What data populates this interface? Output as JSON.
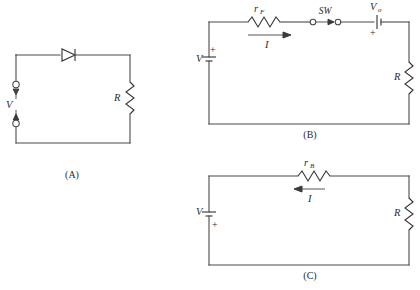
{
  "figure": {
    "background": "#ffffff",
    "line_color": "#4a4a4a",
    "text_color": "#2b2b2b",
    "panel_count": 3
  },
  "panel_a": {
    "caption": "(A)",
    "source_label": "V",
    "resistor_label": "R",
    "diode": "diode-symbol",
    "terminal_top": "terminal-circle",
    "terminal_bottom": "terminal-circle"
  },
  "panel_b": {
    "caption": "(B)",
    "source_label": "V",
    "source_polarity": "+",
    "series_resistor_label": "r",
    "series_resistor_sub": "F",
    "switch_label": "SW",
    "current_label": "I",
    "current_direction": "right",
    "offset_source_label": "V",
    "offset_source_sub": "o",
    "offset_polarity": "+",
    "load_resistor_label": "R"
  },
  "panel_c": {
    "caption": "(C)",
    "source_label": "V",
    "source_polarity": "+",
    "series_resistor_label": "r",
    "series_resistor_sub": "B",
    "current_label": "I",
    "current_direction": "left",
    "load_resistor_label": "R"
  }
}
